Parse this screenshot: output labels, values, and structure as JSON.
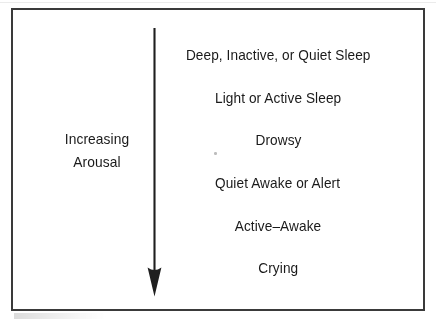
{
  "figure": {
    "type": "arousal-continuum-diagram",
    "axis": {
      "label_line1": "Increasing",
      "label_line2": "Arousal",
      "direction": "downward",
      "arrow_icon": "down-arrow-icon"
    },
    "states": [
      {
        "label": "Deep, Inactive, or Quiet Sleep",
        "rank": 1
      },
      {
        "label": "Light or Active Sleep",
        "rank": 2
      },
      {
        "label": "Drowsy",
        "rank": 3
      },
      {
        "label": "Quiet Awake or Alert",
        "rank": 4
      },
      {
        "label": "Active–Awake",
        "rank": 5
      },
      {
        "label": "Crying",
        "rank": 6
      }
    ],
    "colors": {
      "ink": "#1a1a1a",
      "border": "#3a3a3a",
      "background": "#ffffff"
    }
  }
}
